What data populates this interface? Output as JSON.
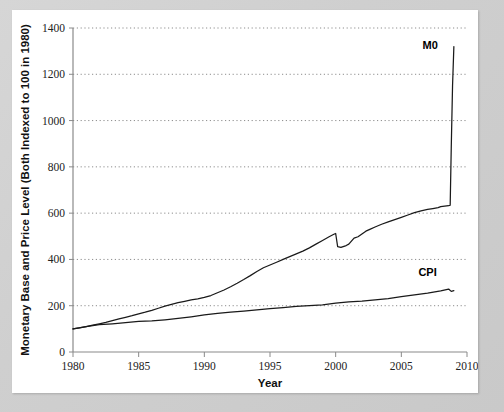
{
  "figure": {
    "background_color": "#cdcdcd",
    "card_color": "#ffffff"
  },
  "chart_data": {
    "type": "line",
    "title": "",
    "xlabel": "Year",
    "ylabel": "Monetary Base and Price Level (Both Indexed to 100 in 1980)",
    "xlim": [
      1980,
      2010
    ],
    "ylim": [
      0,
      1400
    ],
    "xticks": [
      1980,
      1985,
      1990,
      1995,
      2000,
      2005,
      2010
    ],
    "xtick_labels": [
      "1980",
      "1985",
      "1990",
      "1995",
      "2000",
      "2005",
      "2010"
    ],
    "yticks": [
      0,
      200,
      400,
      600,
      800,
      1000,
      1200,
      1400
    ],
    "ytick_labels": [
      "0",
      "200",
      "400",
      "600",
      "800",
      "1000",
      "1200",
      "1400"
    ],
    "grid": "horizontal-dotted",
    "legend_position": "inline-annotations",
    "line_color": "#1a1a1a",
    "series": [
      {
        "name": "M0",
        "label": "M0",
        "label_x": 2007.2,
        "label_y": 1310,
        "x": [
          1980,
          1980.5,
          1981,
          1981.5,
          1982,
          1982.5,
          1983,
          1983.5,
          1984,
          1984.5,
          1985,
          1985.5,
          1986,
          1986.5,
          1987,
          1987.5,
          1988,
          1988.5,
          1989,
          1989.5,
          1990,
          1990.5,
          1991,
          1991.5,
          1992,
          1992.5,
          1993,
          1993.5,
          1994,
          1994.5,
          1995,
          1995.5,
          1996,
          1996.5,
          1997,
          1997.5,
          1998,
          1998.5,
          1999,
          1999.5,
          1999.9,
          2000.0,
          2000.15,
          2000.4,
          2000.8,
          2001,
          2001.4,
          2001.7,
          2002,
          2002.3,
          2002.6,
          2003,
          2003.5,
          2004,
          2004.5,
          2005,
          2005.5,
          2006,
          2006.5,
          2007,
          2007.4,
          2007.8,
          2008,
          2008.3,
          2008.6,
          2008.72,
          2008.8,
          2008.9,
          2009.0
        ],
        "values": [
          100,
          104,
          110,
          116,
          122,
          128,
          136,
          143,
          150,
          157,
          165,
          172,
          180,
          189,
          198,
          206,
          213,
          219,
          225,
          230,
          236,
          244,
          256,
          268,
          282,
          297,
          313,
          330,
          348,
          364,
          376,
          388,
          400,
          412,
          424,
          436,
          450,
          466,
          482,
          498,
          510,
          512,
          455,
          452,
          460,
          466,
          492,
          498,
          510,
          522,
          530,
          540,
          552,
          562,
          572,
          582,
          592,
          602,
          610,
          616,
          620,
          624,
          628,
          630,
          632,
          634,
          880,
          1150,
          1320
        ]
      },
      {
        "name": "CPI",
        "label": "CPI",
        "label_x": 2007.0,
        "label_y": 330,
        "x": [
          1980,
          1981,
          1982,
          1983,
          1984,
          1985,
          1986,
          1987,
          1988,
          1989,
          1990,
          1991,
          1992,
          1993,
          1994,
          1995,
          1996,
          1997,
          1998,
          1999,
          2000,
          2001,
          2002,
          2003,
          2004,
          2005,
          2006,
          2007,
          2008,
          2008.6,
          2008.8,
          2009.0
        ],
        "values": [
          100,
          110,
          118,
          122,
          127,
          132,
          134,
          139,
          145,
          152,
          160,
          167,
          172,
          177,
          182,
          187,
          192,
          197,
          200,
          204,
          211,
          217,
          220,
          225,
          231,
          239,
          247,
          254,
          264,
          272,
          262,
          265
        ]
      }
    ]
  }
}
